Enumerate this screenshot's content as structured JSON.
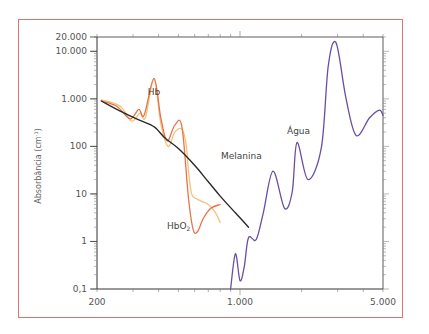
{
  "chart_data": {
    "type": "line",
    "title": "",
    "xlabel": "",
    "ylabel": "Absorbância (cm-1)",
    "x_scale": "log",
    "y_scale": "log",
    "xlim": [
      200,
      5000
    ],
    "ylim": [
      0.1,
      20000
    ],
    "x_tick_labels": [
      "200",
      "1.000",
      "5.000"
    ],
    "y_tick_labels": [
      "20.000",
      "10.000",
      "1.000",
      "100",
      "10",
      "1",
      "0,1"
    ],
    "grid": false,
    "legend": "inline labels",
    "series": [
      {
        "name": "Hb",
        "color": "#e8734a",
        "points": [
          [
            210,
            900
          ],
          [
            250,
            700
          ],
          [
            290,
            380
          ],
          [
            320,
            600
          ],
          [
            340,
            450
          ],
          [
            380,
            2700
          ],
          [
            410,
            400
          ],
          [
            440,
            130
          ],
          [
            480,
            280
          ],
          [
            520,
            260
          ],
          [
            560,
            8
          ],
          [
            590,
            1.8
          ],
          [
            620,
            1.6
          ],
          [
            660,
            3
          ],
          [
            720,
            5
          ],
          [
            800,
            6
          ]
        ]
      },
      {
        "name": "HbO2",
        "color": "#f2c27a",
        "points": [
          [
            210,
            950
          ],
          [
            260,
            700
          ],
          [
            295,
            340
          ],
          [
            325,
            500
          ],
          [
            345,
            400
          ],
          [
            380,
            2600
          ],
          [
            410,
            300
          ],
          [
            445,
            100
          ],
          [
            480,
            200
          ],
          [
            520,
            230
          ],
          [
            545,
            110
          ],
          [
            560,
            30
          ],
          [
            580,
            10
          ],
          [
            610,
            8
          ],
          [
            650,
            7
          ],
          [
            700,
            6
          ],
          [
            760,
            4
          ],
          [
            800,
            2.5
          ]
        ]
      },
      {
        "name": "Melanina",
        "color": "#2a2a2a",
        "points": [
          [
            210,
            900
          ],
          [
            260,
            550
          ],
          [
            320,
            360
          ],
          [
            380,
            260
          ],
          [
            430,
            150
          ],
          [
            500,
            90
          ],
          [
            600,
            40
          ],
          [
            700,
            18
          ],
          [
            800,
            9
          ],
          [
            950,
            4
          ],
          [
            1100,
            2
          ]
        ]
      },
      {
        "name": "Água",
        "color": "#6b4f9e",
        "points": [
          [
            900,
            0.1
          ],
          [
            950,
            0.55
          ],
          [
            1000,
            0.15
          ],
          [
            1050,
            0.3
          ],
          [
            1100,
            1.2
          ],
          [
            1200,
            1.1
          ],
          [
            1300,
            4
          ],
          [
            1450,
            30
          ],
          [
            1650,
            5
          ],
          [
            1800,
            11
          ],
          [
            1900,
            120
          ],
          [
            2150,
            20
          ],
          [
            2500,
            95
          ],
          [
            2700,
            5000
          ],
          [
            2950,
            15000
          ],
          [
            3300,
            1000
          ],
          [
            3700,
            170
          ],
          [
            4300,
            400
          ],
          [
            4800,
            580
          ],
          [
            5000,
            450
          ]
        ]
      }
    ],
    "annotations": [
      {
        "text": "Hb",
        "near": [
          380,
          5000
        ]
      },
      {
        "text": "HbO2",
        "near": [
          520,
          1.8
        ]
      },
      {
        "text": "Melanina",
        "near": [
          820,
          45
        ]
      },
      {
        "text": "Água",
        "near": [
          1900,
          450
        ]
      }
    ]
  },
  "labels": {
    "hb": "Hb",
    "hbo2_main": "HbO",
    "hbo2_sub": "2",
    "melanina": "Melanina",
    "agua": "Água",
    "ylabel_main": "Absorbância (cm",
    "ylabel_sup": "-1",
    "ylabel_close": ")"
  },
  "y_ticks": [
    {
      "label": "20.000",
      "value": 20000
    },
    {
      "label": "10.000",
      "value": 10000
    },
    {
      "label": "1.000",
      "value": 1000
    },
    {
      "label": "100",
      "value": 100
    },
    {
      "label": "10",
      "value": 10
    },
    {
      "label": "1",
      "value": 1
    },
    {
      "label": "0,1",
      "value": 0.1
    }
  ],
  "x_ticks": [
    {
      "label": "200",
      "value": 200
    },
    {
      "label": "1.000",
      "value": 1000
    },
    {
      "label": "5.000",
      "value": 5000
    }
  ],
  "colors": {
    "frame": "#d9786a",
    "axis": "#333333",
    "hb": "#e8734a",
    "hbo2": "#f2c27a",
    "melanina": "#2a2a2a",
    "agua": "#6b4f9e"
  }
}
